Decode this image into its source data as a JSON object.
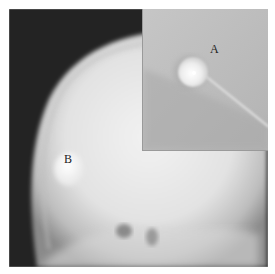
{
  "figure": {
    "type": "radiograph",
    "labels": {
      "a": "A",
      "b": "B"
    },
    "colors": {
      "background": "#222222",
      "bone": "#e8e8e8",
      "inset_bg": "#bdbdbd",
      "label": "#222222"
    }
  }
}
